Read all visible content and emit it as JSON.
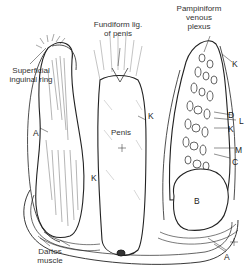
{
  "figure": {
    "labels": {
      "superficial_inguinal_ring": "Superficial\ninguinal ring",
      "fundiform_lig": "Fundiform lig.\nof penis",
      "pampiniform": "Pampiniform\nvenous\nplexus",
      "penis": "Penis",
      "dartos": "Dartos\nmuscle"
    },
    "letters": {
      "A_left": "A",
      "K_left": "K",
      "K_penis": "K",
      "K_top_right": "K",
      "D": "D",
      "L": "L",
      "K_right": "K",
      "M": "M",
      "C": "C",
      "B": "B",
      "A_bottom": "A"
    },
    "colors": {
      "ink": "#222222",
      "background": "#ffffff"
    }
  }
}
